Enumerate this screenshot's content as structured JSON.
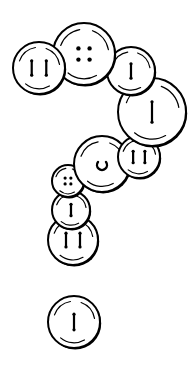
{
  "illustration": {
    "subject": "Buttons arranged in the shape of a question mark",
    "style": "black line-art on white",
    "colors": {
      "ink": "#000000",
      "paper": "#ffffff",
      "fill": "#ffffff"
    },
    "buttons": [
      {
        "id": "button-left-two-bars",
        "holes": "two-bars"
      },
      {
        "id": "button-top-four-holes",
        "holes": "four-holes"
      },
      {
        "id": "button-right-single-bar",
        "holes": "single-bar"
      },
      {
        "id": "button-large-curve",
        "holes": "single-bar"
      },
      {
        "id": "button-middle-c",
        "holes": "c-shape"
      },
      {
        "id": "button-small-two-bars",
        "holes": "two-bars"
      },
      {
        "id": "button-small-four-holes",
        "holes": "four-holes"
      },
      {
        "id": "button-stack-single-bar",
        "holes": "single-bar"
      },
      {
        "id": "button-stack-two-bars",
        "holes": "two-bars"
      },
      {
        "id": "button-dot",
        "holes": "single-bar"
      }
    ]
  }
}
